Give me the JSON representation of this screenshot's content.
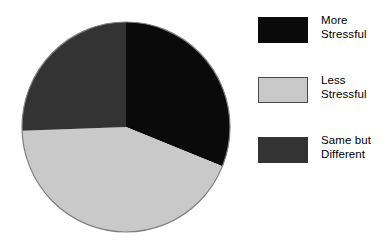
{
  "chart_data": {
    "type": "pie",
    "title": "",
    "subtitle": "",
    "xlabel": "",
    "ylabel": "",
    "grid": false,
    "legend_position": "right",
    "start_angle_deg": 0,
    "direction": "clockwise",
    "categories": [
      "More Stressful",
      "Less Stressful",
      "Same but Different"
    ],
    "values": [
      31,
      43,
      26
    ],
    "unit": "percent",
    "slices": [
      {
        "label": "More Stressful",
        "label_line1": "More",
        "label_line2": "Stressful",
        "value": 31,
        "start_angle_deg": 0,
        "end_angle_deg": 112,
        "color": "#0a0a0a"
      },
      {
        "label": "Less Stressful",
        "label_line1": "Less",
        "label_line2": "Stressful",
        "value": 43,
        "start_angle_deg": 112,
        "end_angle_deg": 268,
        "color": "#c9c9c9"
      },
      {
        "label": "Same but Different",
        "label_line1": "Same but",
        "label_line2": "Different",
        "value": 26,
        "start_angle_deg": 268,
        "end_angle_deg": 360,
        "color": "#333333"
      }
    ],
    "geometry": {
      "center_x": 105,
      "center_y": 105,
      "radius": 104,
      "outline_color": "#808080"
    }
  },
  "legend": {
    "items": [
      {
        "label": "More\nStressful",
        "line1": "More",
        "line2": "Stressful",
        "color": "#0a0a0a",
        "border": "#0a0a0a"
      },
      {
        "label": "Less\nStressful",
        "line1": "Less",
        "line2": "Stressful",
        "color": "#c9c9c9",
        "border": "#4a4a4a"
      },
      {
        "label": "Same but\nDifferent",
        "line1": "Same but",
        "line2": "Different",
        "color": "#333333",
        "border": "#333333"
      }
    ]
  }
}
